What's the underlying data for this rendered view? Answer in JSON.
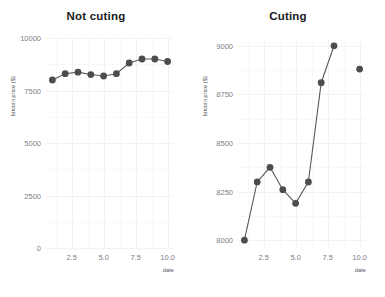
{
  "figure": {
    "width": 385,
    "height": 297,
    "background": "#ffffff",
    "marker_color": "#4d4d4d",
    "line_color": "#595959",
    "grid_color": "#f2f2f4",
    "tick_label_color": "#808080",
    "title_color": "#1a1a1a"
  },
  "chart_data": [
    {
      "type": "line",
      "title": "Not cuting",
      "xlabel": "date",
      "ylabel": "bitcoin price ($)",
      "x": [
        1,
        2,
        3,
        4,
        5,
        6,
        7,
        8,
        9,
        10
      ],
      "values": [
        8000,
        8300,
        8375,
        8260,
        8190,
        8300,
        8810,
        9000,
        9000,
        8880
      ],
      "xlim": [
        0.5,
        10.5
      ],
      "ylim": [
        0,
        10000
      ],
      "xticks": [
        2.5,
        5.0,
        7.5,
        10.0
      ],
      "xtick_labels": [
        "2.5",
        "5.0",
        "7.5",
        "10.0"
      ],
      "yticks": [
        0,
        2500,
        5000,
        7500,
        10000
      ],
      "ytick_labels": [
        "0",
        "2500",
        "5000",
        "7500",
        "10000"
      ],
      "grid": true,
      "legend": "none",
      "connected": true
    },
    {
      "type": "line",
      "title": "Cuting",
      "xlabel": "date",
      "ylabel": "bitcoin price ($)",
      "x": [
        1,
        2,
        3,
        4,
        5,
        6,
        7,
        8,
        10
      ],
      "values": [
        8000,
        8300,
        8375,
        8260,
        8190,
        8300,
        8810,
        9000,
        8880
      ],
      "xlim": [
        0.5,
        10.5
      ],
      "ylim": [
        7960,
        9040
      ],
      "xticks": [
        2.5,
        5.0,
        7.5,
        10.0
      ],
      "xtick_labels": [
        "2.5",
        "5.0",
        "7.5",
        "10.0"
      ],
      "yticks": [
        8000,
        8250,
        8500,
        8750,
        9000
      ],
      "ytick_labels": [
        "8000",
        "8250",
        "8500",
        "8750",
        "9000"
      ],
      "grid": true,
      "legend": "none",
      "connected": true,
      "line_break_after_index": 7
    }
  ]
}
